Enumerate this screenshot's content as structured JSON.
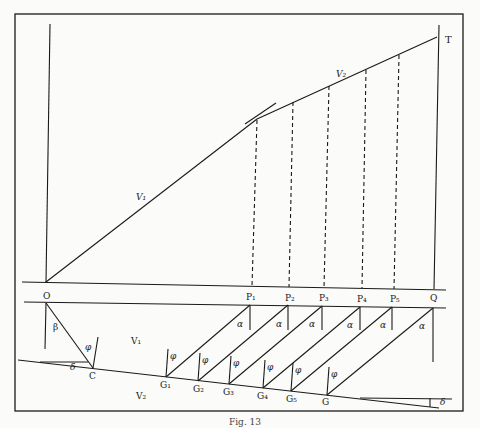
{
  "figure": {
    "caption": "Fig. 13",
    "ink_color": "#1a1a1a",
    "paper_color": "#fbfbf9"
  },
  "labels": {
    "origin": "O",
    "top_point": "T",
    "ground_point": "Q",
    "slope1": "V₁",
    "slope2": "V₂",
    "layer1": "V₁",
    "layer2": "V₂",
    "critical_point": "C",
    "beta": "β",
    "delta_left": "δ",
    "delta_right": "δ",
    "p_points": [
      "P₁",
      "P₂",
      "P₃",
      "P₄",
      "P₅"
    ],
    "g_points": [
      "G₁",
      "G₂",
      "G₃",
      "G₄",
      "G₅",
      "G"
    ],
    "alpha": "α",
    "phi": "φ"
  },
  "geometry": {
    "frame": [
      15,
      14,
      463,
      411
    ],
    "origin": [
      46,
      282
    ],
    "break_point": [
      257,
      119
    ],
    "top": [
      437,
      37
    ],
    "p_x": [
      251,
      288,
      323,
      361,
      393
    ],
    "q_x": 434,
    "g_points": [
      [
        166,
        377
      ],
      [
        198,
        381
      ],
      [
        229,
        384
      ],
      [
        263,
        388
      ],
      [
        291,
        391
      ],
      [
        327,
        395
      ]
    ],
    "c_point": [
      93,
      368
    ]
  }
}
